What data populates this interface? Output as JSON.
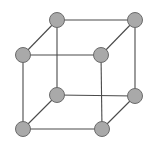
{
  "diagram": {
    "type": "cube-graph",
    "colors": {
      "background": "#ffffff",
      "edge": "#4a4a4a",
      "node_fill": "#a9a9a9",
      "node_stroke": "#6b6b6b"
    },
    "node_radius": 7.5,
    "edge_width": 1.1,
    "nodes": [
      {
        "id": "top-back-left",
        "x": 57,
        "y": 20
      },
      {
        "id": "top-back-right",
        "x": 135,
        "y": 20
      },
      {
        "id": "top-front-left",
        "x": 23,
        "y": 55
      },
      {
        "id": "top-front-right",
        "x": 101,
        "y": 55
      },
      {
        "id": "bottom-back-left",
        "x": 57,
        "y": 95
      },
      {
        "id": "bottom-back-right",
        "x": 135,
        "y": 96
      },
      {
        "id": "bottom-front-left",
        "x": 23,
        "y": 129
      },
      {
        "id": "bottom-front-right",
        "x": 102,
        "y": 129
      }
    ],
    "edges": [
      [
        "top-back-left",
        "top-back-right"
      ],
      [
        "top-front-left",
        "top-front-right"
      ],
      [
        "top-back-left",
        "top-front-left"
      ],
      [
        "top-back-right",
        "top-front-right"
      ],
      [
        "bottom-back-left",
        "bottom-back-right"
      ],
      [
        "bottom-front-left",
        "bottom-front-right"
      ],
      [
        "bottom-back-left",
        "bottom-front-left"
      ],
      [
        "bottom-back-right",
        "bottom-front-right"
      ],
      [
        "top-back-left",
        "bottom-back-left"
      ],
      [
        "top-back-right",
        "bottom-back-right"
      ],
      [
        "top-front-left",
        "bottom-front-left"
      ],
      [
        "top-front-right",
        "bottom-front-right"
      ]
    ]
  }
}
